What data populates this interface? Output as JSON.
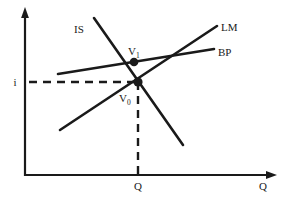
{
  "figure": {
    "type": "line-diagram",
    "background_color": "#ffffff",
    "stroke_color": "#1a1a1a"
  },
  "axes": {
    "vertical": {
      "name": "interest-rate-axis",
      "label": "i",
      "arrow": "up",
      "x_px": 25,
      "y_top_px": 10,
      "y_bottom_px": 176
    },
    "horizontal": {
      "name": "output-axis",
      "label": "Q",
      "arrow": "right",
      "y_px": 175,
      "x_left_px": 25,
      "x_right_px": 276
    }
  },
  "ticks": {
    "x": [
      {
        "label": "Q",
        "x_px": 138
      }
    ],
    "y": [
      {
        "label": "i",
        "y_px": 82
      }
    ]
  },
  "curves": [
    {
      "name": "IS",
      "label": "IS",
      "slope": "downward",
      "label_x_px": 76,
      "label_y_px": 30,
      "x1": 94,
      "y1": 18,
      "x2": 183,
      "y2": 145
    },
    {
      "name": "LM",
      "label": "LM",
      "slope": "upward-steep",
      "label_x_px": 222,
      "label_y_px": 27,
      "x1": 60,
      "y1": 130,
      "x2": 217,
      "y2": 26
    },
    {
      "name": "BP",
      "label": "BP",
      "slope": "upward-shallow",
      "label_x_px": 219,
      "label_y_px": 52,
      "x1": 58,
      "y1": 74,
      "x2": 214,
      "y2": 49
    }
  ],
  "points": [
    {
      "name": "V1",
      "label": "V",
      "subscript": "1",
      "x_px": 134,
      "y_px": 62,
      "label_x_px": 128,
      "label_y_px": 54,
      "description": "IS and BP intersection above equilibrium"
    },
    {
      "name": "V0",
      "label": "V",
      "subscript": "0",
      "x_px": 138,
      "y_px": 82,
      "label_x_px": 118,
      "label_y_px": 102,
      "description": "IS and LM intersection, initial equilibrium"
    }
  ],
  "guide_lines": [
    {
      "name": "horizontal-interest-guide",
      "style": "dashed",
      "x1": 29,
      "y1": 82,
      "x2": 138,
      "y2": 82
    },
    {
      "name": "vertical-output-guide",
      "style": "dashed",
      "x1": 138,
      "y1": 82,
      "x2": 138,
      "y2": 175
    }
  ]
}
